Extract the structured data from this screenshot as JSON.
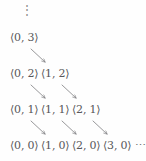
{
  "diagram": {
    "top_ellipsis": "⋮",
    "trailing_ellipsis": "⋯",
    "bracket_open": "⟨",
    "bracket_close": "⟩",
    "text_color": "#57575a",
    "arrow_color": "#7d7d80",
    "background_color": "#fefefe",
    "rows": [
      {
        "index": 0,
        "pairs": [
          {
            "label": "⟨0, 3⟩",
            "x": 0,
            "y": 3
          }
        ],
        "trailing": ""
      },
      {
        "index": 1,
        "pairs": [
          {
            "label": "⟨0, 2⟩",
            "x": 0,
            "y": 2
          },
          {
            "label": "⟨1, 2⟩",
            "x": 1,
            "y": 2
          }
        ],
        "trailing": ""
      },
      {
        "index": 2,
        "pairs": [
          {
            "label": "⟨0, 1⟩",
            "x": 0,
            "y": 1
          },
          {
            "label": "⟨1, 1⟩",
            "x": 1,
            "y": 1
          },
          {
            "label": "⟨2, 1⟩",
            "x": 2,
            "y": 1
          }
        ],
        "trailing": ""
      },
      {
        "index": 3,
        "pairs": [
          {
            "label": "⟨0, 0⟩",
            "x": 0,
            "y": 0
          },
          {
            "label": "⟨1, 0⟩",
            "x": 1,
            "y": 0
          },
          {
            "label": "⟨2, 0⟩",
            "x": 2,
            "y": 0
          },
          {
            "label": "⟨3, 0⟩",
            "x": 3,
            "y": 0
          }
        ],
        "trailing": "⋯"
      }
    ],
    "arrows": [
      {
        "from": "⟨0, 3⟩",
        "to": "⟨1, 2⟩",
        "x1": 31,
        "y1": 49,
        "x2": 45,
        "y2": 62
      },
      {
        "from": "⟨0, 2⟩",
        "to": "⟨1, 1⟩",
        "x1": 31,
        "y1": 85,
        "x2": 45,
        "y2": 98
      },
      {
        "from": "⟨1, 2⟩",
        "to": "⟨2, 1⟩",
        "x1": 62,
        "y1": 85,
        "x2": 76,
        "y2": 98
      },
      {
        "from": "⟨0, 1⟩",
        "to": "⟨1, 0⟩",
        "x1": 31,
        "y1": 121,
        "x2": 45,
        "y2": 134
      },
      {
        "from": "⟨1, 1⟩",
        "to": "⟨2, 0⟩",
        "x1": 62,
        "y1": 121,
        "x2": 76,
        "y2": 134
      },
      {
        "from": "⟨2, 1⟩",
        "to": "⟨3, 0⟩",
        "x1": 93,
        "y1": 121,
        "x2": 107,
        "y2": 134
      }
    ]
  }
}
